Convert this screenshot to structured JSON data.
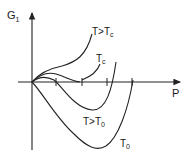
{
  "diagram": {
    "y_axis_label": "G",
    "y_axis_subscript": "1",
    "x_axis_label": "P",
    "curves": [
      {
        "id": "t-gt-tc",
        "label": "T>T",
        "subscript": "c"
      },
      {
        "id": "tc",
        "label": "T",
        "subscript": "c"
      },
      {
        "id": "t-gt-t0",
        "label": "T>T",
        "subscript": "0"
      },
      {
        "id": "t0",
        "label": "T",
        "subscript": "0"
      }
    ],
    "colors": {
      "line": "#222222",
      "text": "#1a1a1a",
      "background": "#ffffff"
    }
  }
}
